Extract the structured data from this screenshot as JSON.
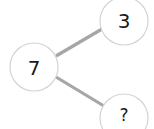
{
  "diagram": {
    "type": "number-bond",
    "colors": {
      "edge": "#a6a6a6",
      "circle_stroke": "#d4d4d4",
      "text": "#1a1a1a"
    },
    "whole": {
      "label": "7"
    },
    "parts": [
      {
        "label": "3"
      },
      {
        "label": "?"
      }
    ]
  }
}
